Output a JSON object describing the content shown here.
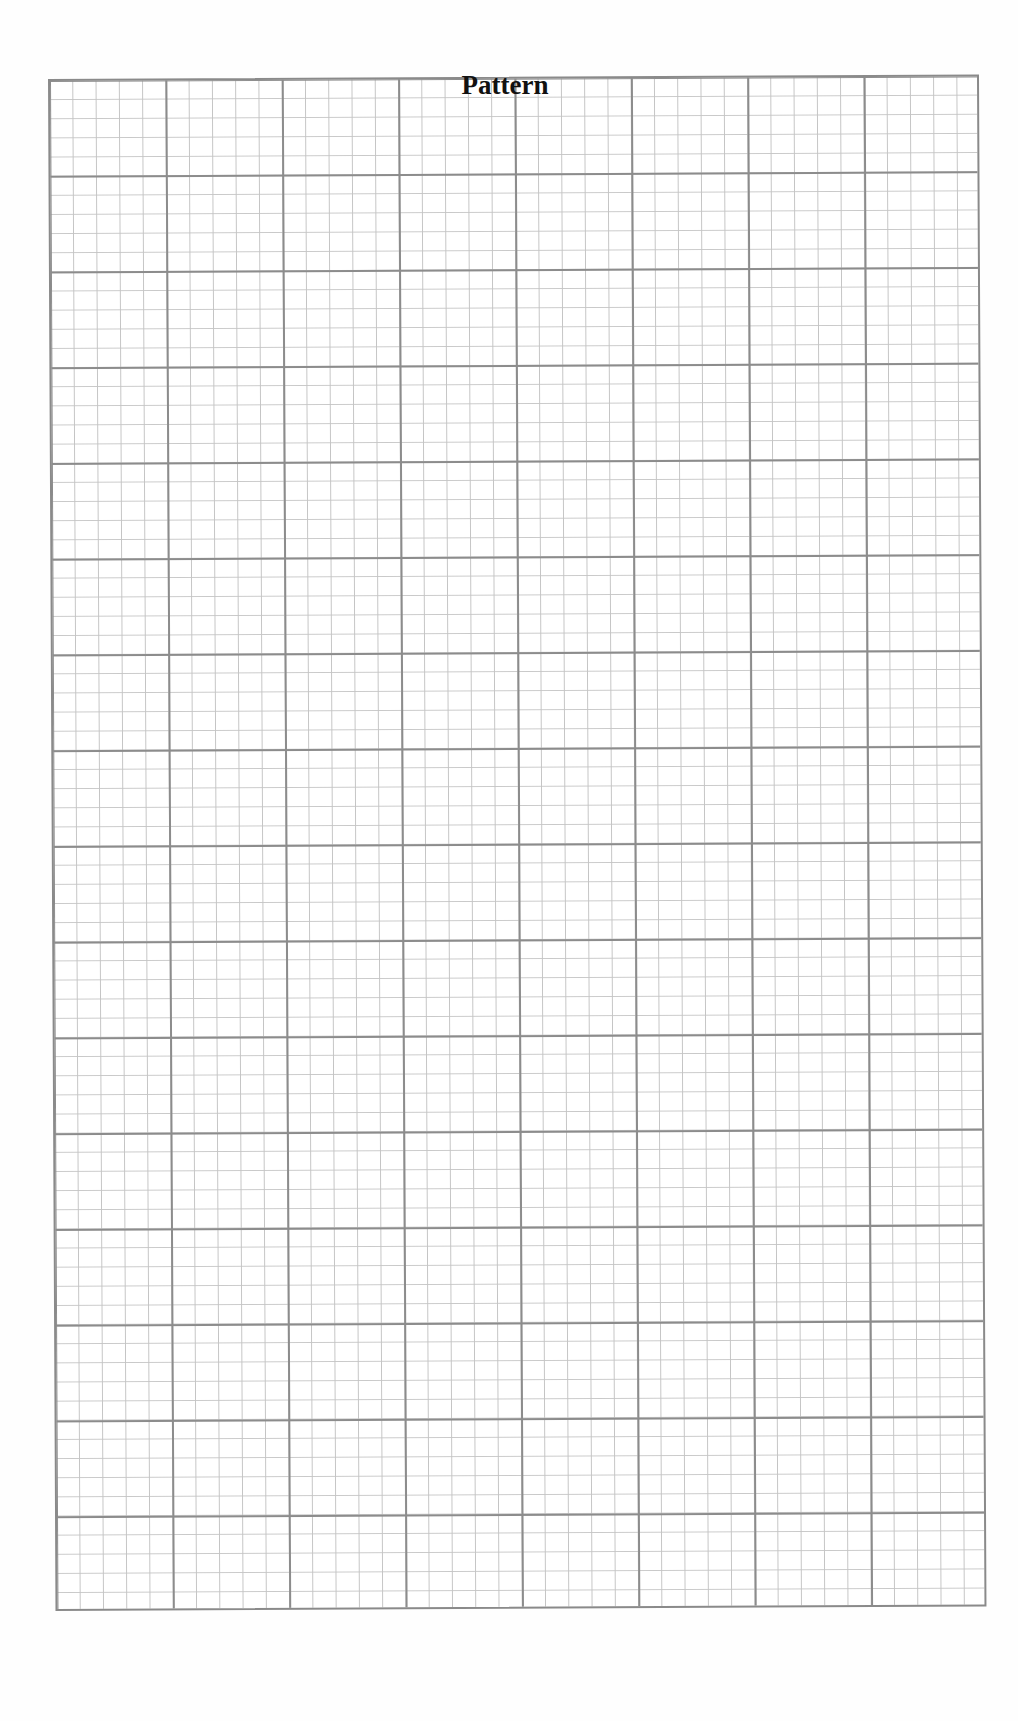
{
  "document": {
    "title": "Pattern",
    "type": "graph-paper",
    "grid": {
      "major_columns": 8,
      "major_rows": 16,
      "minor_subdivisions_per_major": 5,
      "major_line_color": "#8c8c8c",
      "minor_line_color": "#c4c4c4",
      "background_color": "#ffffff"
    }
  }
}
